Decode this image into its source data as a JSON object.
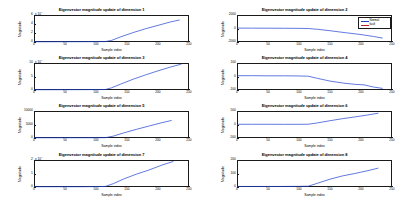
{
  "figure": {
    "background": "#ffffff",
    "axis_color": "#1a1a1a",
    "series_colors": {
      "normal": "#2040d0",
      "fault": "#c02020"
    }
  },
  "legend": {
    "visible_on_subplot": 2,
    "entries": [
      {
        "label": "Normal",
        "color": "#2040d0"
      },
      {
        "label": "fault",
        "color": "#c02020"
      }
    ]
  },
  "common": {
    "xlabel": "Sample index",
    "ylabel": "Magnitude",
    "xticks": [
      "0",
      "50",
      "100",
      "150",
      "200",
      "250"
    ]
  },
  "chart_data": [
    {
      "type": "line",
      "title": "Eigenvector magnitude update of dimension 1",
      "xlabel": "Sample index",
      "ylabel": "Magnitude",
      "exponent_label": "x 10",
      "exponent_power": "4",
      "xlim": [
        0,
        250
      ],
      "ylim": [
        0,
        6
      ],
      "xticks": [
        0,
        50,
        100,
        150,
        200,
        250
      ],
      "yticks": [
        "0",
        "2",
        "4",
        "6"
      ],
      "ytick_values": [
        0,
        2,
        4,
        6
      ],
      "grid": false,
      "series": [
        {
          "name": "Normal",
          "color": "#2040d0",
          "x": [
            0,
            20,
            40,
            60,
            80,
            100,
            115,
            125,
            140,
            160,
            180,
            200,
            220,
            235
          ],
          "values": [
            0.05,
            0.05,
            0.06,
            0.06,
            0.07,
            0.08,
            0.09,
            0.35,
            1.15,
            2.1,
            2.95,
            3.7,
            4.45,
            4.9
          ]
        }
      ]
    },
    {
      "type": "line",
      "title": "Eigenvector magnitude update of dimension 2",
      "xlabel": "Sample index",
      "ylabel": "Magnitude",
      "exponent_label": "",
      "exponent_power": "",
      "xlim": [
        0,
        250
      ],
      "ylim": [
        -2000,
        2000
      ],
      "xticks": [
        0,
        50,
        100,
        150,
        200,
        250
      ],
      "yticks": [
        "2000",
        "0",
        "-2000"
      ],
      "ytick_values": [
        2000,
        0,
        -2000
      ],
      "grid": false,
      "series": [
        {
          "name": "Normal",
          "color": "#2040d0",
          "x": [
            0,
            25,
            50,
            75,
            100,
            115,
            130,
            150,
            175,
            200,
            220,
            235
          ],
          "values": [
            60,
            50,
            45,
            35,
            20,
            0,
            -120,
            -330,
            -620,
            -900,
            -1180,
            -1420
          ]
        }
      ]
    },
    {
      "type": "line",
      "title": "Eigenvector magnitude update of dimension 3",
      "xlabel": "Sample index",
      "ylabel": "Magnitude",
      "exponent_label": "x 10",
      "exponent_power": "4",
      "xlim": [
        0,
        250
      ],
      "ylim": [
        0,
        10
      ],
      "xticks": [
        0,
        50,
        100,
        150,
        200,
        250
      ],
      "yticks": [
        "10",
        "5",
        "0"
      ],
      "ytick_values": [
        10,
        5,
        0
      ],
      "grid": false,
      "series": [
        {
          "name": "Normal",
          "color": "#2040d0",
          "x": [
            0,
            25,
            50,
            75,
            100,
            115,
            125,
            140,
            160,
            180,
            200,
            220,
            238
          ],
          "values": [
            0.1,
            0.1,
            0.12,
            0.13,
            0.15,
            0.18,
            0.8,
            2.2,
            4.0,
            5.6,
            7.1,
            8.5,
            9.6
          ]
        }
      ]
    },
    {
      "type": "line",
      "title": "Eigenvector magnitude update of dimension 4",
      "xlabel": "Sample index",
      "ylabel": "Magnitude",
      "exponent_label": "",
      "exponent_power": "",
      "xlim": [
        0,
        250
      ],
      "ylim": [
        -100,
        100
      ],
      "xticks": [
        0,
        50,
        100,
        150,
        200,
        250
      ],
      "yticks": [
        "100",
        "0",
        "-100"
      ],
      "ytick_values": [
        100,
        0,
        -100
      ],
      "grid": false,
      "series": [
        {
          "name": "Normal",
          "color": "#2040d0",
          "x": [
            0,
            25,
            50,
            75,
            100,
            115,
            130,
            150,
            170,
            190,
            205,
            220,
            235
          ],
          "values": [
            6,
            6,
            5,
            5,
            4,
            2,
            -14,
            -34,
            -48,
            -58,
            -62,
            -78,
            -88
          ]
        }
      ]
    },
    {
      "type": "line",
      "title": "Eigenvector magnitude update of dimension 5",
      "xlabel": "Sample index",
      "ylabel": "Magnitude",
      "exponent_label": "",
      "exponent_power": "",
      "xlim": [
        0,
        250
      ],
      "ylim": [
        0,
        10000
      ],
      "xticks": [
        0,
        50,
        100,
        150,
        200,
        250
      ],
      "yticks": [
        "10000",
        "5000",
        "0"
      ],
      "ytick_values": [
        10000,
        5000,
        0
      ],
      "grid": false,
      "series": [
        {
          "name": "Normal",
          "color": "#2040d0",
          "x": [
            0,
            25,
            50,
            75,
            100,
            115,
            128,
            145,
            165,
            185,
            205,
            222
          ],
          "values": [
            80,
            80,
            90,
            95,
            100,
            120,
            700,
            1900,
            3200,
            4400,
            5600,
            6500
          ]
        }
      ]
    },
    {
      "type": "line",
      "title": "Eigenvector magnitude update of dimension 6",
      "xlabel": "Sample index",
      "ylabel": "Magnitude",
      "exponent_label": "",
      "exponent_power": "",
      "xlim": [
        0,
        250
      ],
      "ylim": [
        -500,
        500
      ],
      "xticks": [
        0,
        50,
        100,
        150,
        200,
        250
      ],
      "yticks": [
        "500",
        "0",
        "-500"
      ],
      "ytick_values": [
        500,
        0,
        -500
      ],
      "grid": false,
      "series": [
        {
          "name": "Normal",
          "color": "#2040d0",
          "x": [
            0,
            25,
            50,
            75,
            100,
            115,
            130,
            150,
            170,
            190,
            210,
            228
          ],
          "values": [
            8,
            8,
            8,
            7,
            7,
            10,
            60,
            140,
            215,
            280,
            350,
            420
          ]
        }
      ]
    },
    {
      "type": "line",
      "title": "Eigenvector magnitude update of dimension 7",
      "xlabel": "Sample index",
      "ylabel": "Magnitude",
      "exponent_label": "x 10",
      "exponent_power": "4",
      "xlim": [
        0,
        250
      ],
      "ylim": [
        0,
        2
      ],
      "xticks": [
        0,
        50,
        100,
        150,
        200,
        250
      ],
      "yticks": [
        "2",
        "1",
        "0"
      ],
      "ytick_values": [
        2,
        1,
        0
      ],
      "grid": false,
      "series": [
        {
          "name": "Normal",
          "color": "#2040d0",
          "x": [
            0,
            25,
            50,
            75,
            100,
            115,
            128,
            145,
            165,
            185,
            205,
            225
          ],
          "values": [
            0.02,
            0.02,
            0.02,
            0.02,
            0.03,
            0.04,
            0.25,
            0.6,
            0.95,
            1.25,
            1.6,
            1.9
          ]
        }
      ]
    },
    {
      "type": "line",
      "title": "Eigenvector magnitude update of dimension 8",
      "xlabel": "Sample index",
      "ylabel": "Magnitude",
      "exponent_label": "",
      "exponent_power": "",
      "xlim": [
        0,
        250
      ],
      "ylim": [
        0,
        200
      ],
      "xticks": [
        0,
        50,
        100,
        150,
        200,
        250
      ],
      "yticks": [
        "200",
        "100",
        "0"
      ],
      "ytick_values": [
        200,
        100,
        0
      ],
      "grid": false,
      "series": [
        {
          "name": "Normal",
          "color": "#2040d0",
          "x": [
            0,
            25,
            50,
            75,
            100,
            115,
            130,
            150,
            170,
            190,
            210,
            228
          ],
          "values": [
            4,
            4,
            4,
            4,
            5,
            6,
            28,
            58,
            82,
            100,
            120,
            140
          ]
        }
      ]
    }
  ]
}
